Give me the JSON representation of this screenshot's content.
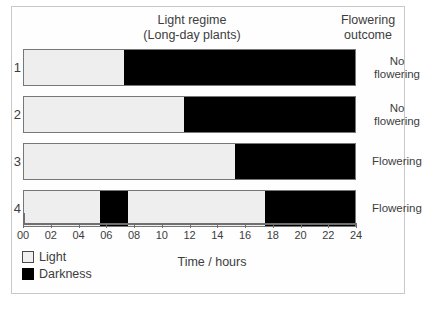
{
  "figure": {
    "headers": {
      "light_regime": "Light regime\n(Long-day plants)",
      "flowering_outcome": "Flowering\noutcome"
    },
    "axis": {
      "title": "Time / hours",
      "min": 0,
      "max": 24,
      "tick_step": 2,
      "tick_labels": [
        "00",
        "02",
        "04",
        "06",
        "08",
        "10",
        "12",
        "14",
        "16",
        "18",
        "20",
        "22",
        "24"
      ]
    },
    "legend": {
      "items": [
        {
          "label": "Light",
          "swatch": "light-swatch-icon",
          "color": "#f0f0f0"
        },
        {
          "label": "Darkness",
          "swatch": "dark-swatch-icon",
          "color": "#000000"
        }
      ]
    },
    "rows": [
      {
        "number": "1",
        "outcome": "No\nflowering"
      },
      {
        "number": "2",
        "outcome": "No\nflowering"
      },
      {
        "number": "3",
        "outcome": "Flowering"
      },
      {
        "number": "4",
        "outcome": "Flowering"
      }
    ]
  },
  "chart_data": {
    "type": "bar",
    "title": "Light regime (Long-day plants)",
    "xlabel": "Time / hours",
    "ylabel": "",
    "xlim": [
      0,
      24
    ],
    "grid": false,
    "legend_position": "bottom-left",
    "colors": {
      "light": "#eeeeee",
      "darkness": "#000000"
    },
    "categories": [
      "1",
      "2",
      "3",
      "4"
    ],
    "series": [
      {
        "name": "1",
        "outcome": "No flowering",
        "segments": [
          {
            "type": "Light",
            "start": 0,
            "end": 7.2
          },
          {
            "type": "Darkness",
            "start": 7.2,
            "end": 24
          }
        ]
      },
      {
        "name": "2",
        "outcome": "No flowering",
        "segments": [
          {
            "type": "Light",
            "start": 0,
            "end": 11.5
          },
          {
            "type": "Darkness",
            "start": 11.5,
            "end": 24
          }
        ]
      },
      {
        "name": "3",
        "outcome": "Flowering",
        "segments": [
          {
            "type": "Light",
            "start": 0,
            "end": 15.2
          },
          {
            "type": "Darkness",
            "start": 15.2,
            "end": 24
          }
        ]
      },
      {
        "name": "4",
        "outcome": "Flowering",
        "segments": [
          {
            "type": "Light",
            "start": 0,
            "end": 5.5
          },
          {
            "type": "Darkness",
            "start": 5.5,
            "end": 7.5
          },
          {
            "type": "Light",
            "start": 7.5,
            "end": 17.4
          },
          {
            "type": "Darkness",
            "start": 17.4,
            "end": 24
          }
        ]
      }
    ]
  }
}
